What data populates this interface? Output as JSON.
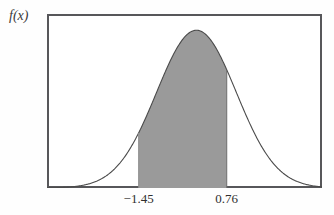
{
  "chart_data": {
    "type": "area",
    "title": "",
    "subtitle": "",
    "xlabel": "",
    "ylabel": "f(x)",
    "grid": false,
    "legend": null,
    "curve": {
      "name": "probability density function",
      "description": "symmetric bell-shaped normal density curve",
      "mean": 0,
      "sd": 1,
      "peak_x": 0,
      "xlim": [
        -3.75,
        3.15
      ],
      "ylim": [
        0,
        0.44
      ],
      "x": [
        -3.75,
        -3.4,
        -3.0,
        -2.6,
        -2.2,
        -1.8,
        -1.45,
        -1.1,
        -0.75,
        -0.4,
        0.0,
        0.4,
        0.76,
        1.1,
        1.5,
        1.9,
        2.3,
        2.7,
        3.15
      ],
      "y": [
        0.0004,
        0.0012,
        0.0044,
        0.0136,
        0.0355,
        0.079,
        0.1394,
        0.2179,
        0.3011,
        0.3683,
        0.3989,
        0.3683,
        0.2989,
        0.2179,
        0.1295,
        0.0656,
        0.0283,
        0.0104,
        0.0028
      ]
    },
    "shaded_region": {
      "label": "shaded area under curve between bounds",
      "lower_bound": -1.45,
      "upper_bound": 0.76,
      "fill_color": "#9a9a9a"
    },
    "xticks": [
      {
        "value": -1.45,
        "label": "−1.45"
      },
      {
        "value": 0.76,
        "label": "0.76"
      }
    ],
    "yticks": [],
    "colors": {
      "frame": "#57575a",
      "curve": "#4a4a4a",
      "shade": "#9a9a9a",
      "background": "#ffffff",
      "text": "#2f2f2f"
    }
  },
  "axis": {
    "y_label": "f(x)"
  }
}
